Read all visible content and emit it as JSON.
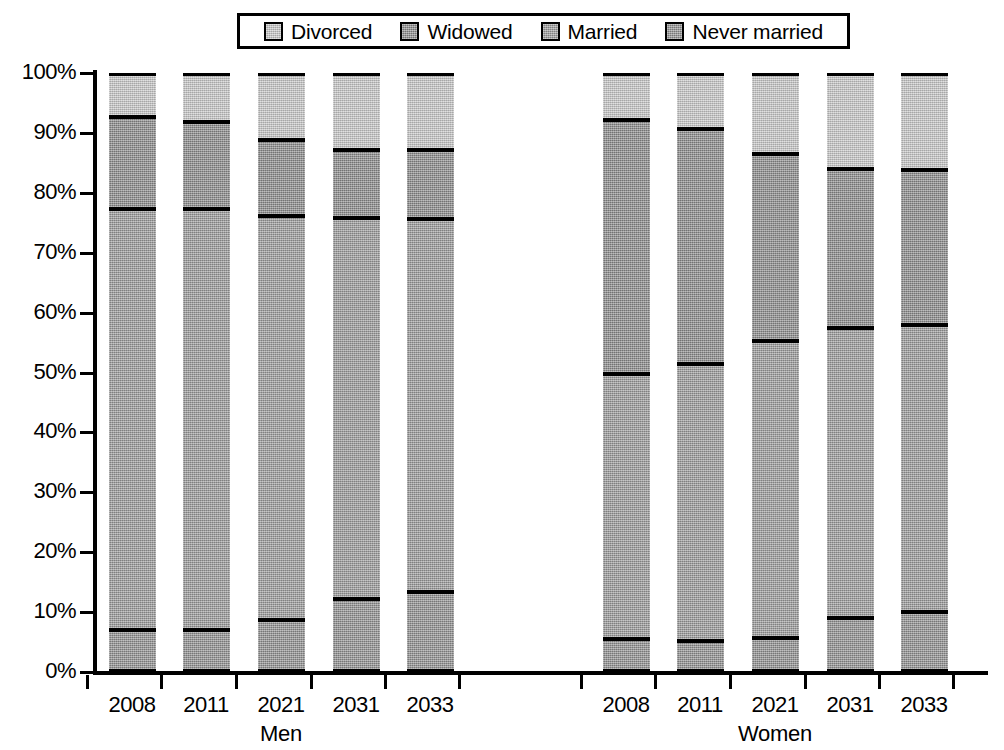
{
  "chart_data": {
    "type": "bar",
    "subtype": "stacked-percentage",
    "title": "",
    "xlabel": "",
    "ylabel": "",
    "ylim": [
      0,
      100
    ],
    "ytick_labels": [
      "0%",
      "10%",
      "20%",
      "30%",
      "40%",
      "50%",
      "60%",
      "70%",
      "80%",
      "90%",
      "100%"
    ],
    "ytick_values": [
      0,
      10,
      20,
      30,
      40,
      50,
      60,
      70,
      80,
      90,
      100
    ],
    "grid": false,
    "legend_position": "top-center",
    "legend": [
      "Divorced",
      "Widowed",
      "Married",
      "Never married"
    ],
    "series": [
      {
        "name": "Never married",
        "color": "#8f8f8f"
      },
      {
        "name": "Married",
        "color": "#9a9a9a"
      },
      {
        "name": "Widowed",
        "color": "#8a8a8a"
      },
      {
        "name": "Divorced",
        "color": "#c8c8c8"
      }
    ],
    "groups": [
      {
        "label": "Men",
        "categories": [
          "2008",
          "2011",
          "2021",
          "2031",
          "2033"
        ],
        "bars": [
          {
            "category": "2008",
            "never_married": 7.0,
            "married": 70.3,
            "widowed": 15.4,
            "divorced": 7.3,
            "cum": [
              7.0,
              77.3,
              92.7,
              100
            ]
          },
          {
            "category": "2011",
            "never_married": 7.0,
            "married": 70.3,
            "widowed": 14.6,
            "divorced": 8.1,
            "cum": [
              7.0,
              77.3,
              91.9,
              100
            ]
          },
          {
            "category": "2021",
            "never_married": 8.7,
            "married": 67.5,
            "widowed": 12.6,
            "divorced": 11.2,
            "cum": [
              8.7,
              76.2,
              88.8,
              100
            ]
          },
          {
            "category": "2031",
            "never_married": 12.2,
            "married": 63.6,
            "widowed": 11.3,
            "divorced": 12.9,
            "cum": [
              12.2,
              75.8,
              87.1,
              100
            ]
          },
          {
            "category": "2033",
            "never_married": 13.3,
            "married": 62.4,
            "widowed": 11.4,
            "divorced": 12.9,
            "cum": [
              13.3,
              75.7,
              87.1,
              100
            ]
          }
        ]
      },
      {
        "label": "Women",
        "categories": [
          "2008",
          "2011",
          "2021",
          "2031",
          "2033"
        ],
        "bars": [
          {
            "category": "2008",
            "never_married": 5.5,
            "married": 44.3,
            "widowed": 42.3,
            "divorced": 7.9,
            "cum": [
              5.5,
              49.8,
              92.1,
              100
            ]
          },
          {
            "category": "2011",
            "never_married": 5.2,
            "married": 46.3,
            "widowed": 39.2,
            "divorced": 9.3,
            "cum": [
              5.2,
              51.5,
              90.7,
              100
            ]
          },
          {
            "category": "2021",
            "never_married": 5.6,
            "married": 49.7,
            "widowed": 31.2,
            "divorced": 13.5,
            "cum": [
              5.6,
              55.3,
              86.5,
              100
            ]
          },
          {
            "category": "2031",
            "never_married": 9.0,
            "married": 48.4,
            "widowed": 26.5,
            "divorced": 16.1,
            "cum": [
              9.0,
              57.4,
              83.9,
              100
            ]
          },
          {
            "category": "2033",
            "never_married": 10.0,
            "married": 48.0,
            "widowed": 25.8,
            "divorced": 16.2,
            "cum": [
              10.0,
              58.0,
              83.8,
              100
            ]
          }
        ]
      }
    ]
  },
  "legend": {
    "items": [
      {
        "label": "Divorced",
        "color": "#c8c8c8"
      },
      {
        "label": "Widowed",
        "color": "#8a8a8a"
      },
      {
        "label": "Married",
        "color": "#9a9a9a"
      },
      {
        "label": "Never married",
        "color": "#8f8f8f"
      }
    ]
  },
  "axes": {
    "y_ticks": [
      "100%",
      "90%",
      "80%",
      "70%",
      "60%",
      "50%",
      "40%",
      "30%",
      "20%",
      "10%",
      "0%"
    ],
    "groups": [
      {
        "label": "Men",
        "years": [
          "2008",
          "2011",
          "2021",
          "2031",
          "2033"
        ]
      },
      {
        "label": "Women",
        "years": [
          "2008",
          "2011",
          "2021",
          "2031",
          "2033"
        ]
      }
    ]
  }
}
